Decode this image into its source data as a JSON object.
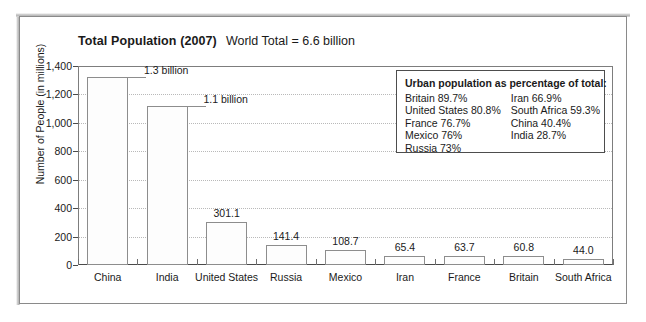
{
  "chart_data": {
    "type": "bar",
    "title": "Total Population (2007)",
    "subtitle": "World Total = 6.6 billion",
    "xlabel": "",
    "ylabel": "Number of People (in millions)",
    "ylim": [
      0,
      1400
    ],
    "ytick_labels": [
      "1,400",
      "1,200",
      "1,000",
      "800",
      "600",
      "400",
      "200",
      "0"
    ],
    "ytick_values": [
      1400,
      1200,
      1000,
      800,
      600,
      400,
      200,
      0
    ],
    "grid": true,
    "legend": "none",
    "categories": [
      "China",
      "India",
      "United States",
      "Russia",
      "Mexico",
      "Iran",
      "France",
      "Britain",
      "South Africa"
    ],
    "values": [
      1320,
      1120,
      301.1,
      141.4,
      108.7,
      65.4,
      63.7,
      60.8,
      44.0
    ],
    "value_labels": [
      "1.3 billion",
      "1.1 billion",
      "301.1",
      "141.4",
      "108.7",
      "65.4",
      "63.7",
      "60.8",
      "44.0"
    ]
  },
  "urban_box": {
    "title": "Urban population as percentage of total:",
    "left_column": [
      "Britain 89.7%",
      "United States 80.8%",
      "France 76.7%",
      "Mexico 76%",
      "Russia 73%"
    ],
    "right_column": [
      "Iran 66.9%",
      "South Africa 59.3%",
      "China 40.4%",
      "India 28.7%"
    ]
  },
  "colors": {
    "bar_fill": "#fdfdfd",
    "bar_border": "#8d8d8d",
    "gridline": "#b9b9b9",
    "axis": "#4a4a4a",
    "frame": "#8a8a8a",
    "text": "#1a1a1a"
  }
}
